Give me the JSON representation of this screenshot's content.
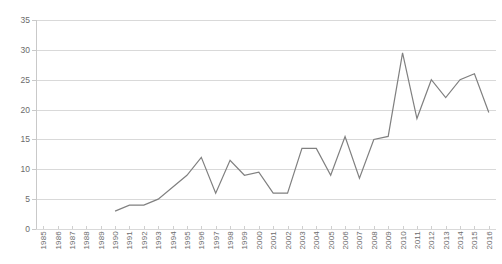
{
  "chart_data": {
    "type": "line",
    "title": "",
    "xlabel": "",
    "ylabel": "",
    "ylim": [
      0,
      35
    ],
    "ytick_step": 5,
    "yticks": [
      0,
      5,
      10,
      15,
      20,
      25,
      30,
      35
    ],
    "grid": true,
    "legend": false,
    "legend_position": "none",
    "line_color": "#808080",
    "categories": [
      "1985",
      "1986",
      "1987",
      "1988",
      "1989",
      "1990",
      "1991",
      "1992",
      "1993",
      "1994",
      "1995",
      "1996",
      "1997",
      "1998",
      "1999",
      "2000",
      "2001",
      "2002",
      "2003",
      "2004",
      "2005",
      "2006",
      "2007",
      "2008",
      "2009",
      "2010",
      "2011",
      "2012",
      "2013",
      "2014",
      "2015",
      "2016"
    ],
    "series": [
      {
        "name": "",
        "values": [
          null,
          null,
          null,
          null,
          null,
          3,
          4,
          4,
          5,
          7,
          9,
          12,
          6,
          11.5,
          9,
          9.5,
          6,
          6,
          13.5,
          13.5,
          9,
          15.5,
          8.5,
          15,
          15.5,
          29.5,
          18.5,
          25,
          22,
          25,
          26,
          19.5
        ]
      }
    ]
  },
  "axis": {
    "y_labels": [
      "35",
      "30",
      "25",
      "20",
      "15",
      "10",
      "5",
      "0"
    ],
    "x_labels": [
      "1985",
      "1986",
      "1987",
      "1988",
      "1989",
      "1990",
      "1991",
      "1992",
      "1993",
      "1994",
      "1995",
      "1996",
      "1997",
      "1998",
      "1999",
      "2000",
      "2001",
      "2002",
      "2003",
      "2004",
      "2005",
      "2006",
      "2007",
      "2008",
      "2009",
      "2010",
      "2011",
      "2012",
      "2013",
      "2014",
      "2015",
      "2016"
    ]
  }
}
